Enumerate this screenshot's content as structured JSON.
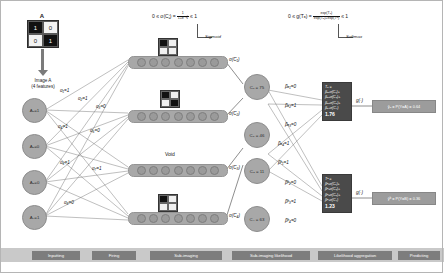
{
  "figure": {
    "matrix_title": "A",
    "matrix_cells": [
      [
        "1",
        "0"
      ],
      [
        "0",
        "1"
      ]
    ],
    "image_caption": "Image A\n(4 features)"
  },
  "formulas": {
    "sigmoid": "0 ≤ σ(Cⱼ) =",
    "sigmoid_num": "1",
    "sigmoid_den": "1+e⁻ᶜⱼ",
    "sigmoid_tail": "≤ 1",
    "sigmoid_name": "Sigmoid",
    "softmax": "0 ≤ g(Tₐ) =",
    "softmax_num": "exp(Tₐ)",
    "softmax_den": "exp(Tₐ)+exp(Tᵇ)",
    "softmax_tail": "≤ 1",
    "softmax_name": "Softmax"
  },
  "inputs": [
    {
      "label": "A₁=1"
    },
    {
      "label": "A₂=0"
    },
    {
      "label": "A₃=0"
    },
    {
      "label": "A₄=1"
    }
  ],
  "bars": [
    {
      "sigma": "σ(C₁)"
    },
    {
      "sigma": "σ(C₂)"
    },
    {
      "sigma": "σ(C₃)"
    },
    {
      "sigma": "σ(C₄)"
    }
  ],
  "void_label": "Void",
  "mid_nodes": [
    {
      "label": "C₁ = 75"
    },
    {
      "label": "C₂ = 46"
    },
    {
      "label": "C₃ = 11"
    },
    {
      "label": "C₄ = 63"
    }
  ],
  "weights": {
    "alpha": [
      "α₁=1",
      "α₂=1",
      "α₃=0",
      "α₄=1",
      "α₅=0",
      "α₆=1",
      "α₇=1",
      "α₈=0"
    ],
    "beta_a": [
      "βₐ₁=0",
      "βₐ₂=1",
      "βₐ₃=0",
      "βₐ₄=1"
    ],
    "beta_b": [
      "βᵇ₁=1",
      "βᵇ₂=0",
      "βᵇ₃=1",
      "βᵇ₄=0"
    ]
  },
  "aggregation": [
    {
      "title": "Tₐ =",
      "terms": [
        "βₐ₁σ(C₁)+",
        "βₐ₂σ(C₂)+",
        "βₐ₃σ(C₃)+",
        "βₐ₄σ(C₄)"
      ],
      "total": "1.76"
    },
    {
      "title": "Tᵇ =",
      "terms": [
        "βᵇ₁σ(C₁)+",
        "βᵇ₂σ(C₂)+",
        "βᵇ₃σ(C₃)+",
        "βᵇ₄σ(C₄)"
      ],
      "total": "1.23"
    }
  ],
  "softmax_arrow_label": "g(·)",
  "predictions": [
    {
      "text": "ŷₐ = P(Y=A) = 0.64"
    },
    {
      "text": "ŷᵇ = P(Y=B) = 0.36"
    }
  ],
  "stages": [
    {
      "label": "Inputting"
    },
    {
      "label": "Firing"
    },
    {
      "label": "Sub-imaging"
    },
    {
      "label": "Sub-imaging likelihood"
    },
    {
      "label": "Likelihood aggregation"
    },
    {
      "label": "Predicting"
    }
  ]
}
